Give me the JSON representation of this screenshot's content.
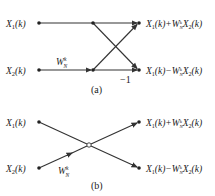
{
  "diagram_a": {
    "caption": "(a)",
    "inputs": [
      "X1(k)",
      "X2(k)"
    ],
    "twiddle": {
      "base": "W",
      "sub": "N",
      "sup": "k"
    },
    "minus_one": "−1",
    "outputs": [
      "X1(k)+W_N^k X2(k)",
      "X1(k)−W_N^k X2(k)"
    ]
  },
  "diagram_b": {
    "caption": "(b)",
    "inputs": [
      "X1(k)",
      "X2(k)"
    ],
    "twiddle": {
      "base": "W",
      "sub": "N",
      "sup": "k"
    },
    "outputs": [
      "X1(k)+W_N^k X2(k)",
      "X1(k)−W_N^k X2(k)"
    ]
  }
}
